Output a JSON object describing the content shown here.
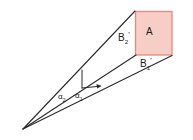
{
  "figure": {
    "type": "geometry-diagram",
    "canvas": {
      "width": 193,
      "height": 140,
      "background": "#ffffff"
    },
    "colors": {
      "line": "#2b2b2b",
      "rect_fill": "#f6cec6",
      "rect_stroke": "#e8897c",
      "text": "#1a1a1a"
    },
    "apex": {
      "x": 23,
      "y": 129
    },
    "rect": {
      "x": 135,
      "y": 11,
      "width": 37,
      "height": 44
    },
    "labels": {
      "area": {
        "base": "A",
        "sub": "",
        "prime": ""
      },
      "side_vertical": {
        "base": "B",
        "sub": "2",
        "prime": "'"
      },
      "side_horizontal": {
        "base": "B",
        "sub": "1",
        "prime": "'"
      },
      "angle_outer": {
        "base": "α",
        "sub": "2",
        "prime": ""
      },
      "angle_inner": {
        "base": "α",
        "sub": "1",
        "prime": ""
      }
    },
    "rays": [
      {
        "name": "upper-ray",
        "from": [
          23,
          129
        ],
        "to": [
          135,
          11
        ]
      },
      {
        "name": "middle-ray",
        "from": [
          23,
          129
        ],
        "to": [
          135,
          55
        ]
      },
      {
        "name": "lower-ray",
        "from": [
          23,
          129
        ],
        "to": [
          172,
          55
        ]
      }
    ],
    "inner_marks": {
      "vertical_segment": {
        "x": 82,
        "y_top": 70,
        "y_bottom": 88
      },
      "horizontal_arrow": {
        "x_start": 82,
        "y_start": 88,
        "x_end": 101,
        "y_end": 86
      }
    }
  }
}
